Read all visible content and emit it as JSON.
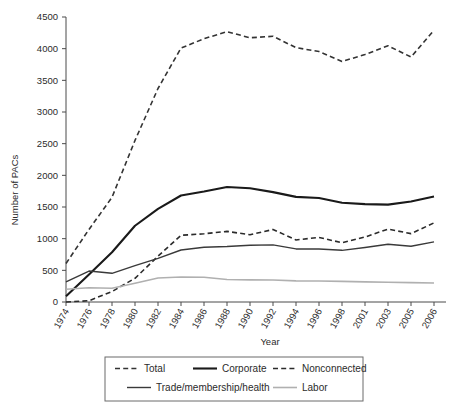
{
  "chart_data": {
    "type": "line",
    "title": "",
    "xlabel": "Year",
    "ylabel": "Number of PACs",
    "grid": false,
    "legend_position": "bottom",
    "xlim": [
      0,
      16
    ],
    "ylim": [
      0,
      4500
    ],
    "ytick_step": 500,
    "yticks": [
      0,
      500,
      1000,
      1500,
      2000,
      2500,
      3000,
      3500,
      4000,
      4500
    ],
    "categories": [
      "1974",
      "1976",
      "1978",
      "1980",
      "1982",
      "1984",
      "1986",
      "1988",
      "1990",
      "1992",
      "1994",
      "1996",
      "1998",
      "2001",
      "2003",
      "2005",
      "2006"
    ],
    "series": [
      {
        "name": "Total",
        "style": "dashed",
        "color": "#333333",
        "width": 1.6,
        "values": [
          608,
          1146,
          1653,
          2551,
          3371,
          4009,
          4157,
          4268,
          4172,
          4195,
          4016,
          3954,
          3798,
          3907,
          4046,
          3868,
          4292
        ]
      },
      {
        "name": "Corporate",
        "style": "solid",
        "color": "#1a1a1a",
        "width": 2.1,
        "values": [
          89,
          433,
          785,
          1204,
          1469,
          1682,
          1744,
          1816,
          1795,
          1735,
          1660,
          1642,
          1567,
          1545,
          1538,
          1587,
          1665
        ]
      },
      {
        "name": "Nonconnected",
        "style": "dashed",
        "color": "#2b2b2b",
        "width": 1.6,
        "values": [
          0,
          20,
          165,
          374,
          723,
          1053,
          1077,
          1115,
          1062,
          1145,
          980,
          1020,
          935,
          1026,
          1151,
          1080,
          1249
        ]
      },
      {
        "name": "Trade/membership/health",
        "style": "solid",
        "color": "#3a3a3a",
        "width": 1.4,
        "values": [
          318,
          489,
          453,
          574,
          689,
          821,
          865,
          877,
          897,
          902,
          838,
          837,
          816,
          860,
          912,
          880,
          950
        ]
      },
      {
        "name": "Labor",
        "style": "solid",
        "color": "#b0b0b0",
        "width": 1.6,
        "values": [
          201,
          224,
          217,
          297,
          380,
          394,
          391,
          355,
          349,
          347,
          333,
          332,
          326,
          317,
          312,
          306,
          300
        ]
      }
    ]
  },
  "legend": {
    "entries": [
      {
        "label": "Total"
      },
      {
        "label": "Corporate"
      },
      {
        "label": "Nonconnected"
      },
      {
        "label": "Trade/membership/health"
      },
      {
        "label": "Labor"
      }
    ]
  }
}
